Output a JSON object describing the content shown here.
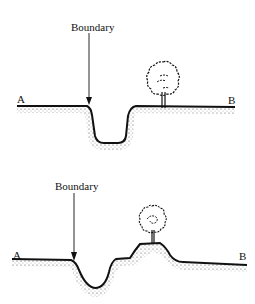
{
  "panels": [
    {
      "id": "top",
      "boundary_label": "Boundary",
      "left_label": "A",
      "right_label": "B",
      "feature": "ditch with tree on level ground"
    },
    {
      "id": "bottom",
      "boundary_label": "Boundary",
      "left_label": "A",
      "right_label": "B",
      "feature": "ditch with bank, tree on bank"
    }
  ],
  "colors": {
    "line": "#111111",
    "stipple": "#555555",
    "background": "#ffffff"
  },
  "icons": {
    "tree": "tree-icon",
    "arrow": "arrow-down-icon"
  }
}
